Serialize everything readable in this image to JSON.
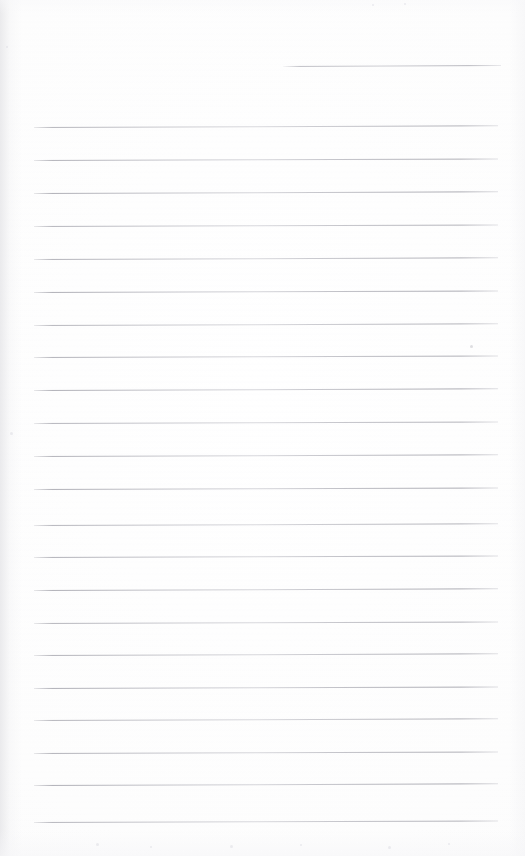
{
  "document": {
    "kind": "scanned-blank-lined-page",
    "title": "",
    "visible_text": "",
    "page_width": 525,
    "page_height": 856,
    "background_color": "#fefefe",
    "rule_color": "#b0b0b8",
    "content": {
      "written_text": "",
      "note": ""
    }
  },
  "ruled_lines": {
    "header_line": {
      "x": 283,
      "y": 66,
      "width": 218,
      "slope_deg": -0.25
    },
    "body_line_left_x": 34,
    "body_line_right_x": 498,
    "body_line_width": 464,
    "spacing_px": 32.8,
    "count": 22,
    "lines": [
      {
        "y": 127,
        "slope_deg": -0.22
      },
      {
        "y": 160,
        "slope_deg": -0.2
      },
      {
        "y": 193,
        "slope_deg": -0.22
      },
      {
        "y": 226,
        "slope_deg": -0.18
      },
      {
        "y": 259,
        "slope_deg": -0.22
      },
      {
        "y": 292,
        "slope_deg": -0.2
      },
      {
        "y": 325,
        "slope_deg": -0.22
      },
      {
        "y": 357,
        "slope_deg": -0.18
      },
      {
        "y": 390,
        "slope_deg": -0.22
      },
      {
        "y": 423,
        "slope_deg": -0.2
      },
      {
        "y": 456,
        "slope_deg": -0.22
      },
      {
        "y": 489,
        "slope_deg": -0.18
      },
      {
        "y": 525,
        "slope_deg": -0.22
      },
      {
        "y": 557,
        "slope_deg": -0.2
      },
      {
        "y": 590,
        "slope_deg": -0.22
      },
      {
        "y": 623,
        "slope_deg": -0.18
      },
      {
        "y": 655,
        "slope_deg": -0.22
      },
      {
        "y": 688,
        "slope_deg": -0.2
      },
      {
        "y": 720,
        "slope_deg": -0.22
      },
      {
        "y": 753,
        "slope_deg": -0.18
      },
      {
        "y": 785,
        "slope_deg": -0.22
      },
      {
        "y": 822,
        "slope_deg": -0.2
      }
    ]
  },
  "artifacts": {
    "specks": [
      {
        "x": 470,
        "y": 345,
        "size": 3,
        "faint": false
      },
      {
        "x": 6,
        "y": 46,
        "size": 2,
        "faint": true
      },
      {
        "x": 372,
        "y": 4,
        "size": 2,
        "faint": true
      },
      {
        "x": 404,
        "y": 3,
        "size": 2,
        "faint": true
      },
      {
        "x": 10,
        "y": 432,
        "size": 3,
        "faint": true
      },
      {
        "x": 96,
        "y": 843,
        "size": 3,
        "faint": true
      },
      {
        "x": 150,
        "y": 846,
        "size": 2,
        "faint": true
      },
      {
        "x": 230,
        "y": 845,
        "size": 3,
        "faint": true
      },
      {
        "x": 300,
        "y": 844,
        "size": 2,
        "faint": true
      },
      {
        "x": 388,
        "y": 846,
        "size": 3,
        "faint": true
      },
      {
        "x": 448,
        "y": 843,
        "size": 2,
        "faint": true
      }
    ]
  }
}
